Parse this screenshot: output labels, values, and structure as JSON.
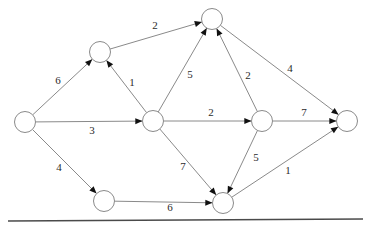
{
  "figure": {
    "kind": "directed-weighted-graph",
    "node_radius": 10.5,
    "stroke_color": "#8a8a8a",
    "label_color": "#2b2b2b",
    "arrow_color": "#111111",
    "background": "#ffffff",
    "rule_color": "#4a4a4a"
  },
  "nodes": [
    {
      "id": "n-left",
      "name": "node-left",
      "cx": 25,
      "cy": 122
    },
    {
      "id": "n-upper-left",
      "name": "node-upper-left",
      "cx": 100,
      "cy": 52
    },
    {
      "id": "n-top",
      "name": "node-top",
      "cx": 212,
      "cy": 19
    },
    {
      "id": "n-center",
      "name": "node-center",
      "cx": 153,
      "cy": 121
    },
    {
      "id": "n-right-mid",
      "name": "node-right-middle",
      "cx": 262,
      "cy": 121
    },
    {
      "id": "n-right",
      "name": "node-right",
      "cx": 347,
      "cy": 121
    },
    {
      "id": "n-bottom-left",
      "name": "node-bottom-left",
      "cx": 104,
      "cy": 201
    },
    {
      "id": "n-bottom-right",
      "name": "node-bottom-right",
      "cx": 223,
      "cy": 203
    }
  ],
  "edges": [
    {
      "id": "e-left-upperleft",
      "from": "n-left",
      "to": "n-upper-left",
      "weight": "6",
      "lx": 58,
      "ly": 81
    },
    {
      "id": "e-left-center",
      "from": "n-left",
      "to": "n-center",
      "weight": "3",
      "lx": 92,
      "ly": 131
    },
    {
      "id": "e-left-bottomleft",
      "from": "n-left",
      "to": "n-bottom-left",
      "weight": "4",
      "lx": 59,
      "ly": 168
    },
    {
      "id": "e-upperleft-top",
      "from": "n-upper-left",
      "to": "n-top",
      "weight": "2",
      "lx": 155,
      "ly": 26
    },
    {
      "id": "e-center-upperleft",
      "from": "n-center",
      "to": "n-upper-left",
      "weight": "1",
      "lx": 132,
      "ly": 83
    },
    {
      "id": "e-center-top",
      "from": "n-center",
      "to": "n-top",
      "weight": "5",
      "lx": 190,
      "ly": 75
    },
    {
      "id": "e-center-rightmid",
      "from": "n-center",
      "to": "n-right-mid",
      "weight": "2",
      "lx": 211,
      "ly": 113
    },
    {
      "id": "e-center-bottomright",
      "from": "n-center",
      "to": "n-bottom-right",
      "weight": "7",
      "lx": 183,
      "ly": 167
    },
    {
      "id": "e-rightmid-top",
      "from": "n-right-mid",
      "to": "n-top",
      "weight": "2",
      "lx": 248,
      "ly": 76
    },
    {
      "id": "e-rightmid-right",
      "from": "n-right-mid",
      "to": "n-right",
      "weight": "7",
      "lx": 304,
      "ly": 113
    },
    {
      "id": "e-rightmid-bottomright",
      "from": "n-right-mid",
      "to": "n-bottom-right",
      "weight": "5",
      "lx": 256,
      "ly": 158
    },
    {
      "id": "e-top-right",
      "from": "n-top",
      "to": "n-right",
      "weight": "4",
      "lx": 290,
      "ly": 69
    },
    {
      "id": "e-bottomleft-bottomright",
      "from": "n-bottom-left",
      "to": "n-bottom-right",
      "weight": "6",
      "lx": 170,
      "ly": 208
    },
    {
      "id": "e-bottomright-right",
      "from": "n-bottom-right",
      "to": "n-right",
      "weight": "1",
      "lx": 288,
      "ly": 171
    }
  ],
  "rule": {
    "name": "bottom-horizontal-rule",
    "x1": 8,
    "y1": 221,
    "x2": 363,
    "y2": 219
  }
}
